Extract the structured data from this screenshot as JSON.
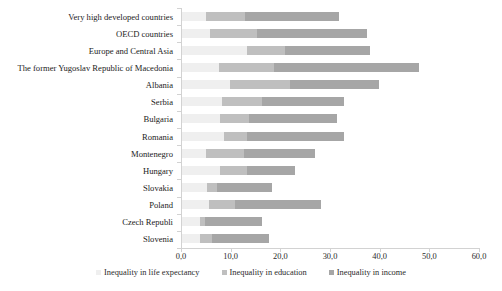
{
  "chart_data": {
    "type": "bar",
    "orientation": "horizontal",
    "stacked": true,
    "title": "",
    "subtitle": "",
    "xlabel": "",
    "ylabel": "",
    "xlim": [
      0.0,
      60.0
    ],
    "xticks": [
      "0,0",
      "10,0",
      "20,0",
      "30,0",
      "40,0",
      "50,0",
      "60,0"
    ],
    "xtick_values": [
      0,
      10,
      20,
      30,
      40,
      50,
      60
    ],
    "grid": false,
    "legend_position": "bottom",
    "categories": [
      "Very high developed countries",
      "OECD countries",
      "Europe and Central Asia",
      "The former Yugoslav Republic of Macedonia",
      "Albania",
      "Serbia",
      "Bulgaria",
      "Romania",
      "Montenegro",
      "Hungary",
      "Slovakia",
      "Poland",
      "Czech Republi",
      "Slovenia"
    ],
    "series": [
      {
        "name": "Inequality in life expectancy",
        "color": "#efefef",
        "values": [
          4.8,
          5.6,
          13.1,
          7.4,
          9.7,
          8.0,
          7.6,
          8.4,
          4.8,
          7.6,
          5.0,
          5.4,
          3.6,
          3.6
        ]
      },
      {
        "name": "Inequality in education",
        "color": "#bfbfbf",
        "values": [
          7.9,
          9.5,
          7.6,
          11.1,
          12.0,
          8.1,
          5.8,
          4.7,
          7.7,
          5.5,
          2.0,
          5.3,
          1.0,
          2.4
        ]
      },
      {
        "name": "Inequality in income",
        "color": "#a6a6a6",
        "values": [
          18.9,
          22.1,
          17.1,
          29.2,
          17.9,
          16.5,
          17.8,
          19.5,
          14.3,
          9.6,
          11.1,
          17.3,
          11.5,
          11.5
        ]
      }
    ],
    "totals": [
      31.6,
      37.2,
      37.8,
      47.7,
      39.6,
      32.6,
      31.2,
      32.6,
      26.8,
      22.7,
      18.1,
      28.0,
      16.1,
      17.5
    ]
  },
  "legend": {
    "items": [
      {
        "label": "Inequality in life expectancy",
        "color": "#efefef"
      },
      {
        "label": "Inequality in education",
        "color": "#bfbfbf"
      },
      {
        "label": "Inequality in income",
        "color": "#a6a6a6"
      }
    ]
  },
  "colors": {
    "axis": "#d2d2d2",
    "text": "#2b2b2b",
    "background": "#ffffff"
  }
}
